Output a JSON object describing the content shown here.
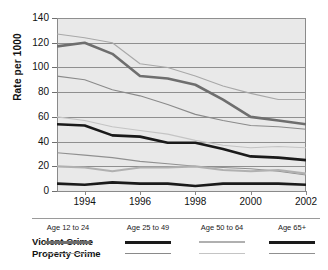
{
  "chart_data": {
    "type": "line",
    "title": "",
    "xlabel": "",
    "ylabel": "Rate per 1000",
    "x": [
      1993,
      1994,
      1995,
      1996,
      1997,
      1998,
      1999,
      2000,
      2001,
      2002
    ],
    "xticks": [
      1994,
      1996,
      1998,
      2000,
      2002
    ],
    "yticks": [
      0,
      20,
      40,
      60,
      80,
      100,
      120,
      140
    ],
    "ylim": [
      0,
      140
    ],
    "xlim": [
      1993,
      2002
    ],
    "grid": "horizontal",
    "legend_position": "bottom",
    "series": [
      {
        "name": "Violent Crime Age 12 to 24",
        "crime_type": "Violent Crime",
        "age_group": "Age 12 to 24",
        "color": "#6e6e6e",
        "width": 2.6,
        "values": [
          117,
          120,
          111,
          93,
          91,
          86,
          74,
          60,
          57,
          54
        ]
      },
      {
        "name": "Violent Crime Age 25 to 49",
        "crime_type": "Violent Crime",
        "age_group": "Age 25 to 49",
        "color": "#1a1a1a",
        "width": 2.6,
        "values": [
          54,
          53,
          45,
          44,
          39,
          39,
          34,
          28,
          27,
          25
        ]
      },
      {
        "name": "Violent Crime Age 50 to 64",
        "crime_type": "Violent Crime",
        "age_group": "Age 50 to 64",
        "color": "#b0b0b0",
        "width": 2.2,
        "values": [
          20,
          19,
          16,
          19,
          19,
          20,
          17,
          16,
          17,
          14
        ]
      },
      {
        "name": "Violent Crime Age 65+",
        "crime_type": "Violent Crime",
        "age_group": "Age 65+",
        "color": "#1a1a1a",
        "width": 2.6,
        "values": [
          6,
          5,
          7,
          6,
          6,
          4,
          6,
          6,
          6,
          5
        ]
      },
      {
        "name": "Property Crime Age 12 to 24",
        "crime_type": "Property Crime",
        "age_group": "Age 12 to 24",
        "color": "#a8a8a8",
        "width": 1.1,
        "values": [
          127,
          124,
          120,
          103,
          100,
          93,
          85,
          79,
          74,
          74
        ]
      },
      {
        "name": "Property Crime Age 25 to 49",
        "crime_type": "Property Crime",
        "age_group": "Age 25 to 49",
        "color": "#8a8a8a",
        "width": 1.1,
        "values": [
          93,
          90,
          82,
          77,
          70,
          62,
          57,
          53,
          52,
          50
        ]
      },
      {
        "name": "Property Crime Age 50 to 64",
        "crime_type": "Property Crime",
        "age_group": "Age 50 to 64",
        "color": "#c4c4c4",
        "width": 1.1,
        "values": [
          60,
          57,
          52,
          49,
          46,
          41,
          37,
          35,
          36,
          35
        ]
      },
      {
        "name": "Property Crime Age 65+",
        "crime_type": "Property Crime",
        "age_group": "Age 65+",
        "color": "#909090",
        "width": 1.1,
        "values": [
          31,
          29,
          27,
          24,
          22,
          20,
          19,
          18,
          16,
          13
        ]
      }
    ]
  },
  "legend": {
    "columns": [
      "Age 12 to 24",
      "Age 25 to 49",
      "Age 50 to 64",
      "Age 65+"
    ],
    "rows": [
      "Violent Crime",
      "Property Crime"
    ]
  }
}
